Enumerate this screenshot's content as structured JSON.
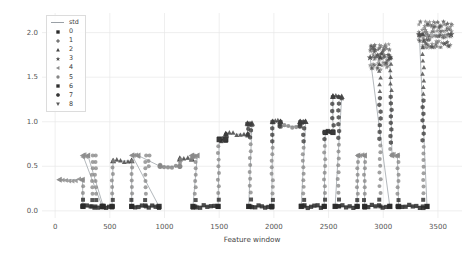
{
  "chart": {
    "type": "scatter",
    "title": "",
    "xlabel": "Feature window",
    "ylabel": "STD of vibration Norm, mm/s^2",
    "xlim": [
      -120,
      3720
    ],
    "ylim": [
      -0.08,
      2.22
    ],
    "xticks": [
      0,
      500,
      1000,
      1500,
      2000,
      2500,
      3000,
      3500
    ],
    "xticklabels": [
      "0",
      "500",
      "1000",
      "1500",
      "2000",
      "2500",
      "3000",
      "3500"
    ],
    "yticks": [
      0.0,
      0.5,
      1.0,
      1.5,
      2.0
    ],
    "yticklabels": [
      "0.0",
      "0.5",
      "1.0",
      "1.5",
      "2.0"
    ],
    "grid": true,
    "grid_color": "#e8e8e8",
    "line_color": "#9aa0a6",
    "background": "#ffffff"
  },
  "legend": {
    "position": "upper-left",
    "entries": [
      {
        "key": "line",
        "marker": "line",
        "label": "std",
        "color": "#9aa0a6"
      },
      {
        "key": "c0",
        "marker": "square",
        "label": "0",
        "color": "#2a2a2a"
      },
      {
        "key": "c1",
        "marker": "plus",
        "label": "1",
        "color": "#3b3b3b"
      },
      {
        "key": "c2",
        "marker": "triangle",
        "label": "2",
        "color": "#454545"
      },
      {
        "key": "c3",
        "marker": "star",
        "label": "3",
        "color": "#4f4f4f"
      },
      {
        "key": "c4",
        "marker": "tri-left",
        "label": "4",
        "color": "#8d8d8d"
      },
      {
        "key": "c5",
        "marker": "circle",
        "label": "5",
        "color": "#868686"
      },
      {
        "key": "c6",
        "marker": "square",
        "label": "6",
        "color": "#2f2f2f"
      },
      {
        "key": "c7",
        "marker": "hexagon",
        "label": "7",
        "color": "#373737"
      },
      {
        "key": "c8",
        "marker": "tri-down",
        "label": "8",
        "color": "#5a5a5a"
      }
    ]
  },
  "chart_data": {
    "type": "scatter",
    "title": "",
    "xlabel": "Feature window",
    "ylabel": "STD of vibration Norm, mm/s^2",
    "xlim": [
      -120,
      3720
    ],
    "ylim": [
      -0.08,
      2.22
    ],
    "xticks": [
      0,
      500,
      1000,
      1500,
      2000,
      2500,
      3000,
      3500
    ],
    "yticks": [
      0.0,
      0.5,
      1.0,
      1.5,
      2.0
    ],
    "grid": true,
    "legend_position": "upper-left",
    "legend_entries": [
      "std",
      "0",
      "1",
      "2",
      "3",
      "4",
      "5",
      "6",
      "7",
      "8"
    ],
    "series": [
      {
        "name": "std",
        "kind": "line",
        "segments": [
          {
            "x_start": 40,
            "x_end": 250,
            "level": 0.35,
            "marker_cluster": 4
          },
          {
            "x_start": 255,
            "x_end": 300,
            "level": 0.62,
            "marker_cluster": 4
          },
          {
            "x_start": 255,
            "x_end": 430,
            "level": 0.05,
            "marker_cluster": 0
          },
          {
            "x_start": 440,
            "x_end": 520,
            "level": 0.05,
            "marker_cluster": 0
          },
          {
            "x_start": 530,
            "x_end": 700,
            "level": 0.56,
            "marker_cluster": 2
          },
          {
            "x_start": 705,
            "x_end": 760,
            "level": 0.62,
            "marker_cluster": 4
          },
          {
            "x_start": 700,
            "x_end": 950,
            "level": 0.05,
            "marker_cluster": 0
          },
          {
            "x_start": 960,
            "x_end": 1140,
            "level": 0.5,
            "marker_cluster": 5
          },
          {
            "x_start": 1140,
            "x_end": 1250,
            "level": 0.58,
            "marker_cluster": 2
          },
          {
            "x_start": 1250,
            "x_end": 1300,
            "level": 0.62,
            "marker_cluster": 4
          },
          {
            "x_start": 1260,
            "x_end": 1490,
            "level": 0.05,
            "marker_cluster": 0
          },
          {
            "x_start": 1500,
            "x_end": 1560,
            "level": 0.8,
            "marker_cluster": 6
          },
          {
            "x_start": 1560,
            "x_end": 1760,
            "level": 0.86,
            "marker_cluster": 2
          },
          {
            "x_start": 1760,
            "x_end": 1800,
            "level": 0.98,
            "marker_cluster": 2
          },
          {
            "x_start": 1770,
            "x_end": 1980,
            "level": 0.05,
            "marker_cluster": 0
          },
          {
            "x_start": 1990,
            "x_end": 2060,
            "level": 1.0,
            "marker_cluster": 2
          },
          {
            "x_start": 2060,
            "x_end": 2240,
            "level": 0.95,
            "marker_cluster": 5
          },
          {
            "x_start": 2240,
            "x_end": 2290,
            "level": 1.0,
            "marker_cluster": 2
          },
          {
            "x_start": 2250,
            "x_end": 2460,
            "level": 0.05,
            "marker_cluster": 0
          },
          {
            "x_start": 2470,
            "x_end": 2540,
            "level": 0.88,
            "marker_cluster": 6
          },
          {
            "x_start": 2540,
            "x_end": 2620,
            "level": 1.28,
            "marker_cluster": 2
          },
          {
            "x_start": 2560,
            "x_end": 2760,
            "level": 0.05,
            "marker_cluster": 0
          },
          {
            "x_start": 2770,
            "x_end": 2830,
            "level": 0.62,
            "marker_cluster": 4
          },
          {
            "x_start": 2830,
            "x_end": 3060,
            "level": 0.05,
            "marker_cluster": 0
          },
          {
            "x_start": 2880,
            "x_end": 3060,
            "level": 1.72,
            "marker_cluster": 3
          },
          {
            "x_start": 3080,
            "x_end": 3130,
            "level": 0.62,
            "marker_cluster": 4
          },
          {
            "x_start": 3140,
            "x_end": 3400,
            "level": 0.05,
            "marker_cluster": 0
          },
          {
            "x_start": 3330,
            "x_end": 3620,
            "level": 1.98,
            "marker_cluster": 3
          }
        ],
        "plateau_levels": [
          0.05,
          0.35,
          0.5,
          0.56,
          0.62,
          0.8,
          0.86,
          0.95,
          1.0,
          1.28,
          1.72,
          1.98
        ],
        "peak_value": 2.1,
        "min_value": 0.02,
        "n_points": 3700
      }
    ],
    "clusters": [
      {
        "id": "0",
        "marker": "square",
        "typical_level": 0.05,
        "note": "low-amplitude idle regime"
      },
      {
        "id": "1",
        "marker": "plus",
        "typical_level": 0.3,
        "note": "sparse"
      },
      {
        "id": "2",
        "marker": "triangle",
        "typical_level": 0.9,
        "note": "upper plateaus / transitions"
      },
      {
        "id": "3",
        "marker": "star",
        "typical_level": 1.85,
        "note": "high-vibration dense clusters"
      },
      {
        "id": "4",
        "marker": "tri-left",
        "typical_level": 0.62,
        "note": "peak tips of mid plateaus"
      },
      {
        "id": "5",
        "marker": "circle",
        "typical_level": 0.5,
        "note": "mid-level plateaus"
      },
      {
        "id": "6",
        "marker": "square",
        "typical_level": 0.8,
        "note": "step shoulders"
      },
      {
        "id": "7",
        "marker": "hexagon",
        "typical_level": 0.45,
        "note": "transition ramps"
      },
      {
        "id": "8",
        "marker": "tri-down",
        "typical_level": 1.95,
        "note": "top of tall risers"
      }
    ]
  }
}
